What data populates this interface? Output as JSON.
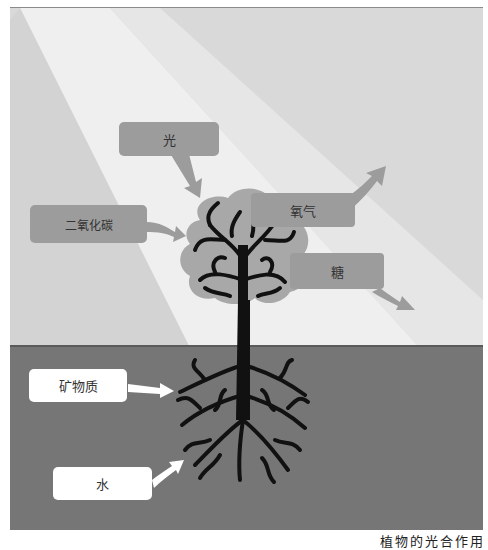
{
  "diagram": {
    "labels": {
      "light": "光",
      "co2": "二氧化碳",
      "oxygen": "氧气",
      "sugar": "糖",
      "minerals": "矿物质",
      "water": "水"
    },
    "caption": "植物的光合作用"
  },
  "colors": {
    "sky": "#dcdcdc",
    "light_beam": "#efefef",
    "ground": "#767676",
    "ground_line": "#555555",
    "input_box": "#9c9c9c",
    "soil_box": "#ffffff",
    "canopy": "#a6a6a6",
    "tree": "#111111"
  }
}
